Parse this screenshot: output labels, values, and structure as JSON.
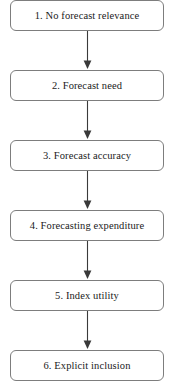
{
  "diagram": {
    "type": "flowchart",
    "orientation": "vertical-top-down",
    "background_color": "#ffffff",
    "node_border_color": "#7d7d7d",
    "node_fill_color": "#ffffff",
    "connector_color": "#3a3a3a",
    "node_count": 6,
    "connector_count": 5,
    "nodes": [
      {
        "id": "node-1",
        "label": "1. No forecast relevance"
      },
      {
        "id": "node-2",
        "label": "2. Forecast need"
      },
      {
        "id": "node-3",
        "label": "3. Forecast accuracy"
      },
      {
        "id": "node-4",
        "label": "4. Forecasting expenditure"
      },
      {
        "id": "node-5",
        "label": "5. Index utility"
      },
      {
        "id": "node-6",
        "label": "6. Explicit inclusion"
      }
    ],
    "connectors": [
      {
        "id": "connector-1",
        "from": "node-1",
        "to": "node-2",
        "arrowhead": "solid-triangle-down"
      },
      {
        "id": "connector-2",
        "from": "node-2",
        "to": "node-3",
        "arrowhead": "solid-triangle-down"
      },
      {
        "id": "connector-3",
        "from": "node-3",
        "to": "node-4",
        "arrowhead": "solid-triangle-down"
      },
      {
        "id": "connector-4",
        "from": "node-4",
        "to": "node-5",
        "arrowhead": "solid-triangle-down"
      },
      {
        "id": "connector-5",
        "from": "node-5",
        "to": "node-6",
        "arrowhead": "solid-triangle-down"
      }
    ]
  }
}
